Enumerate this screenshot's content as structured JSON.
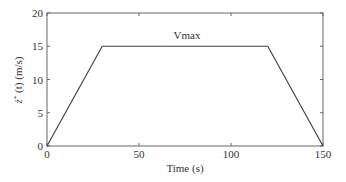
{
  "chart_data": {
    "type": "line",
    "title": "",
    "xlabel": "Time (s)",
    "ylabel": "ż*(t) (m/s)",
    "xlim": [
      0,
      150
    ],
    "ylim": [
      0,
      20
    ],
    "xticks": [
      0,
      50,
      100,
      150
    ],
    "yticks": [
      0,
      5,
      10,
      15,
      20
    ],
    "xtick_labels": [
      "0",
      "50",
      "100",
      "150"
    ],
    "ytick_labels": [
      "0",
      "5",
      "10",
      "15",
      "20"
    ],
    "grid": false,
    "legend": null,
    "annotations": [
      {
        "text": "Vmax",
        "x": 75,
        "y": 16.3
      }
    ],
    "series": [
      {
        "name": "velocity profile",
        "x": [
          0,
          30,
          120,
          150
        ],
        "y": [
          0,
          15,
          15,
          0
        ],
        "color": "#444444"
      }
    ]
  },
  "labels": {
    "xlabel": "Time (s)",
    "ylabel_main": "ż",
    "ylabel_sup": "*",
    "ylabel_rest": " (t) (m/s)",
    "annotation": "Vmax"
  }
}
